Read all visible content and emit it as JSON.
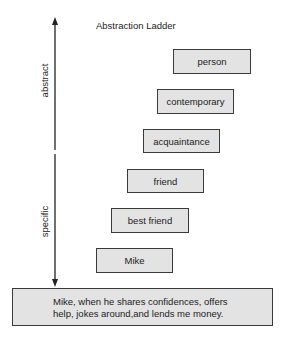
{
  "title": "Abstraction Ladder",
  "axis": {
    "top_label": "abstract",
    "bottom_label": "specific"
  },
  "rungs": [
    {
      "label": "person"
    },
    {
      "label": "contemporary"
    },
    {
      "label": "acquaintance"
    },
    {
      "label": "friend"
    },
    {
      "label": "best friend"
    },
    {
      "label": "Mike"
    }
  ],
  "base": {
    "line1": "Mike, when he shares confidences, offers",
    "line2": "help, jokes around,and lends me money."
  },
  "colors": {
    "box_fill": "#e3e3e3",
    "box_border": "#3a3a3a",
    "arrow": "#222222"
  }
}
